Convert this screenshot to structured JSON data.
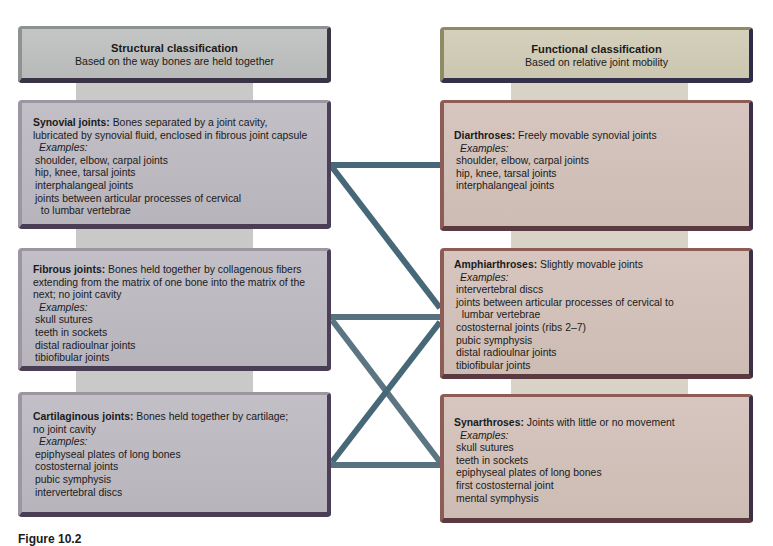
{
  "structural": {
    "header": {
      "title": "Structural classification",
      "subtitle": "Based on the way bones are held together"
    },
    "boxes": [
      {
        "term": "Synovial joints:",
        "description": [
          " Bones separated by a joint cavity,",
          "lubricated by synovial fluid, enclosed in fibrous joint capsule"
        ],
        "examples_label": "Examples:",
        "examples": [
          "shoulder, elbow, carpal joints",
          "hip, knee, tarsal joints",
          "interphalangeal joints",
          "joints between articular processes of cervical",
          "  to lumbar vertebrae"
        ]
      },
      {
        "term": "Fibrous joints:",
        "description": [
          " Bones held together by collagenous fibers",
          "extending from the matrix of one bone into the matrix of the",
          "next; no joint cavity"
        ],
        "examples_label": "Examples:",
        "examples": [
          "skull sutures",
          "teeth in sockets",
          "distal radioulnar joints",
          "tibiofibular joints"
        ]
      },
      {
        "term": "Cartilaginous joints:",
        "description": [
          " Bones held together by cartilage;",
          "no joint cavity"
        ],
        "examples_label": "Examples:",
        "examples": [
          "epiphyseal plates of long bones",
          "costosternal joints",
          "pubic symphysis",
          "intervertebral discs"
        ]
      }
    ]
  },
  "functional": {
    "header": {
      "title": "Functional classification",
      "subtitle": "Based on relative joint mobility"
    },
    "boxes": [
      {
        "term": "Diarthroses:",
        "description": [
          " Freely movable synovial joints"
        ],
        "examples_label": "Examples:",
        "examples": [
          "shoulder, elbow, carpal joints",
          "hip, knee, tarsal joints",
          "interphalangeal joints"
        ]
      },
      {
        "term": "Amphiarthroses:",
        "description": [
          " Slightly movable joints"
        ],
        "examples_label": "Examples:",
        "examples": [
          "intervertebral discs",
          "joints between articular processes of cervical to",
          "  lumbar vertebrae",
          "costosternal joints (ribs 2–7)",
          "pubic symphysis",
          "distal radioulnar joints",
          "tibiofibular joints"
        ]
      },
      {
        "term": "Synarthroses:",
        "description": [
          " Joints with little or no movement"
        ],
        "examples_label": "Examples:",
        "examples": [
          "skull sutures",
          "teeth in sockets",
          "epiphyseal plates of long bones",
          "first costosternal joint",
          "mental symphysis"
        ]
      }
    ]
  },
  "connections": [
    {
      "from": "Synovial joints",
      "to": "Diarthroses"
    },
    {
      "from": "Synovial joints",
      "to": "Amphiarthroses"
    },
    {
      "from": "Fibrous joints",
      "to": "Amphiarthroses"
    },
    {
      "from": "Fibrous joints",
      "to": "Synarthroses"
    },
    {
      "from": "Cartilaginous joints",
      "to": "Amphiarthroses"
    },
    {
      "from": "Cartilaginous joints",
      "to": "Synarthroses"
    }
  ],
  "colors": {
    "connector": "#466878",
    "structural_box": "#bdbac1",
    "functional_box": "#d2c1ba",
    "structural_header": "#bdc0be",
    "functional_header": "#cfcab5"
  },
  "caption": "Figure 10.2"
}
